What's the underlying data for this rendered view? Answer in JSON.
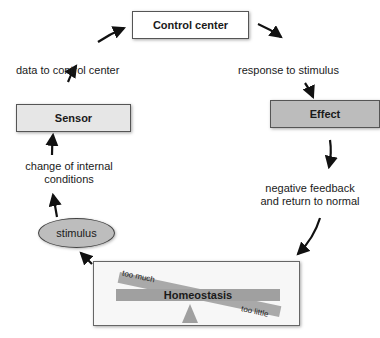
{
  "diagram": {
    "nodes": {
      "control_center": "Control center",
      "sensor": "Sensor",
      "effect": "Effect",
      "stimulus": "stimulus",
      "homeostasis": "Homeostasis"
    },
    "edge_labels": {
      "sensor_to_control": "data to control center",
      "control_to_effect": "response to stimulus",
      "stimulus_to_sensor_line1": "change of internal",
      "stimulus_to_sensor_line2": "conditions",
      "effect_to_homeostasis_line1": "negative feedback",
      "effect_to_homeostasis_line2": "and return to normal"
    },
    "balance_labels": {
      "too_much": "too much",
      "too_little": "too little"
    },
    "colors": {
      "control_center_fill": "#ffffff",
      "sensor_fill": "#e6e6e6",
      "effect_fill": "#bcbcbc",
      "stimulus_fill": "#bdbdbd",
      "beam_fill": "#a0a0a0",
      "arrow": "#111111"
    }
  }
}
